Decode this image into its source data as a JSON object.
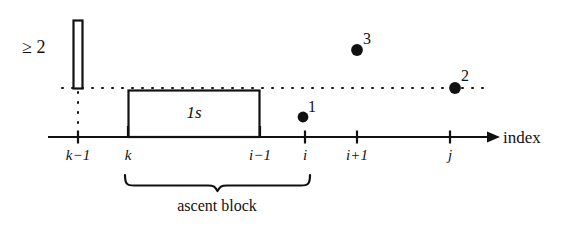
{
  "figure": {
    "colors": {
      "ink": "#111111",
      "background": "#ffffff"
    },
    "axis": {
      "title": "index",
      "ticks": [
        {
          "id": "k-minus-1",
          "label": "k−1",
          "x": 78
        },
        {
          "id": "k",
          "label": "k",
          "x": 128
        },
        {
          "id": "i-minus-1",
          "label": "i−1",
          "x": 260
        },
        {
          "id": "i",
          "label": "i",
          "x": 305
        },
        {
          "id": "i-plus-1",
          "label": "i+1",
          "x": 357
        },
        {
          "id": "j",
          "label": "j",
          "x": 450
        }
      ]
    },
    "threshold_bar": {
      "label": "≥ 2"
    },
    "ascent_block": {
      "box_label": "1s",
      "brace_caption": "ascent block"
    },
    "points": [
      {
        "label": "1",
        "x": 303,
        "y": 117
      },
      {
        "label": "3",
        "x": 357,
        "y": 50
      },
      {
        "label": "2",
        "x": 455,
        "y": 88
      }
    ]
  }
}
